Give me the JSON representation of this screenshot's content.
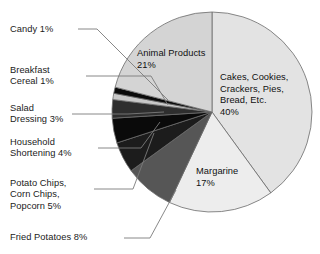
{
  "chart_data": {
    "type": "pie",
    "title": "",
    "subtitle": "",
    "xlabel": "",
    "ylabel": "",
    "legend_position": "none",
    "grid": false,
    "units": "percent",
    "start_angle_deg": 0,
    "direction": "clockwise",
    "categories": [
      "Cakes, Cookies, Crackers, Pies, Bread, Etc.",
      "Margarine",
      "Fried Potatoes",
      "Potato Chips, Corn Chips, Popcorn",
      "Household Shortening",
      "Salad Dressing",
      "Breakfast Cereal",
      "Candy",
      "Animal Products"
    ],
    "values": [
      40,
      17,
      8,
      5,
      4,
      3,
      1,
      1,
      21
    ],
    "colors": [
      "#e3e3e3",
      "#ededed",
      "#565656",
      "#1c1c1c",
      "#0a0a0a",
      "#2e2e2e",
      "#c9c9c9",
      "#0a0a0a",
      "#d4d4d4"
    ],
    "slice_outline_color": "#6b6b6b",
    "leader_line_color": "#7a7a7a",
    "background": "#ffffff"
  },
  "labels": {
    "inside": [
      {
        "name": "cakes",
        "lines": [
          "Cakes, Cookies,",
          "Crackers, Pies,",
          "Bread, Etc.",
          "40%"
        ],
        "text": "Cakes, Cookies,\nCrackers, Pies,\nBread, Etc.\n40%"
      },
      {
        "name": "animal-products",
        "lines": [
          "Animal Products",
          "21%"
        ],
        "text": "Animal Products\n21%"
      },
      {
        "name": "margarine",
        "lines": [
          "Margarine",
          "17%"
        ],
        "text": "Margarine\n17%"
      }
    ],
    "outside": [
      {
        "name": "candy",
        "lines": [
          "Candy 1%"
        ],
        "text": "Candy 1%"
      },
      {
        "name": "breakfast-cereal",
        "lines": [
          "Breakfast",
          "Cereal 1%"
        ],
        "text": "Breakfast\nCereal 1%"
      },
      {
        "name": "salad-dressing",
        "lines": [
          "Salad",
          "Dressing 3%"
        ],
        "text": "Salad\nDressing 3%"
      },
      {
        "name": "household-shortening",
        "lines": [
          "Household",
          "Shortening 4%"
        ],
        "text": "Household\nShortening 4%"
      },
      {
        "name": "potato-chips",
        "lines": [
          "Potato Chips,",
          "Corn Chips,",
          "Popcorn 5%"
        ],
        "text": "Potato Chips,\nCorn Chips,\nPopcorn 5%"
      },
      {
        "name": "fried-potatoes",
        "lines": [
          "Fried Potatoes 8%"
        ],
        "text": "Fried Potatoes 8%"
      }
    ]
  }
}
